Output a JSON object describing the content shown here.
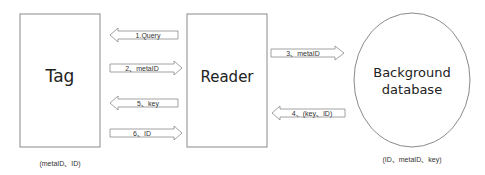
{
  "nodes": {
    "tag": {
      "label": "Tag",
      "caption": "(metaID、ID)"
    },
    "reader": {
      "label": "Reader"
    },
    "database": {
      "label_line1": "Background",
      "label_line2": "database",
      "caption": "(ID、metaID、key)"
    }
  },
  "arrows": [
    {
      "label": "1.Query",
      "from": "reader",
      "to": "tag",
      "direction": "left"
    },
    {
      "label": "2、metaID",
      "from": "tag",
      "to": "reader",
      "direction": "right"
    },
    {
      "label": "5、key",
      "from": "reader",
      "to": "tag",
      "direction": "left"
    },
    {
      "label": "6、ID",
      "from": "tag",
      "to": "reader",
      "direction": "right"
    },
    {
      "label": "3、metaID",
      "from": "reader",
      "to": "database",
      "direction": "right"
    },
    {
      "label": "4、(key、ID)",
      "from": "database",
      "to": "reader",
      "direction": "left"
    }
  ],
  "colors": {
    "stroke": "#8a8a8a",
    "text": "#222222",
    "background": "#ffffff"
  }
}
